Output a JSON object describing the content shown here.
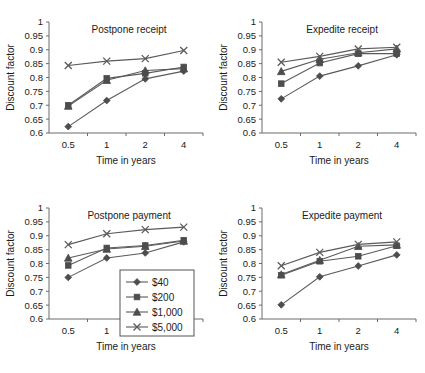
{
  "figure": {
    "name": "discount-factor-panels",
    "panel_count": 4
  },
  "axis": {
    "ylabel": "Discount factor",
    "xlabel": "Time in years",
    "ytick_labels": [
      "1",
      "0.95",
      "0.9",
      "0.85",
      "0.8",
      "0.75",
      "0.7",
      "0.65",
      "0.6"
    ],
    "xtick_labels": [
      "0.5",
      "1",
      "2",
      "4"
    ]
  },
  "legend": {
    "position": "bottom-left-panel-inset",
    "entries": [
      {
        "label": "$40",
        "marker": "diamond"
      },
      {
        "label": "$200",
        "marker": "square"
      },
      {
        "label": "$1,000",
        "marker": "triangle"
      },
      {
        "label": "$5,000",
        "marker": "cross-x"
      }
    ]
  },
  "colors": {
    "line": "#5a5a5a",
    "marker": "#4d4d4d",
    "axis": "#6b6b6b",
    "text": "#1a1a1a",
    "background": "#ffffff"
  },
  "chart_data": [
    {
      "type": "line",
      "title": "Postpone receipt",
      "xlabel": "Time in years",
      "ylabel": "Discount factor",
      "categories": [
        "0.5",
        "1",
        "2",
        "4"
      ],
      "ylim": [
        0.6,
        1
      ],
      "ytick_step": 0.05,
      "grid": false,
      "legend_position": "none",
      "series": [
        {
          "name": "$40",
          "marker": "diamond",
          "values": [
            0.623,
            0.717,
            0.795,
            0.823
          ]
        },
        {
          "name": "$200",
          "marker": "square",
          "values": [
            0.7,
            0.797,
            0.815,
            0.838
          ]
        },
        {
          "name": "$1,000",
          "marker": "triangle",
          "values": [
            0.697,
            0.79,
            0.825,
            0.832
          ]
        },
        {
          "name": "$5,000",
          "marker": "cross-x",
          "values": [
            0.843,
            0.859,
            0.868,
            0.897
          ]
        }
      ]
    },
    {
      "type": "line",
      "title": "Expedite receipt",
      "xlabel": "Time in years",
      "ylabel": "Discount factor",
      "categories": [
        "0.5",
        "1",
        "2",
        "4"
      ],
      "ylim": [
        0.6,
        1
      ],
      "ytick_step": 0.05,
      "grid": false,
      "legend_position": "none",
      "series": [
        {
          "name": "$40",
          "marker": "diamond",
          "values": [
            0.723,
            0.805,
            0.842,
            0.882
          ]
        },
        {
          "name": "$200",
          "marker": "square",
          "values": [
            0.778,
            0.852,
            0.886,
            0.886
          ]
        },
        {
          "name": "$1,000",
          "marker": "triangle",
          "values": [
            0.822,
            0.866,
            0.889,
            0.903
          ]
        },
        {
          "name": "$5,000",
          "marker": "cross-x",
          "values": [
            0.855,
            0.876,
            0.903,
            0.909
          ]
        }
      ]
    },
    {
      "type": "line",
      "title": "Postpone payment",
      "xlabel": "Time in years",
      "ylabel": "Discount factor",
      "categories": [
        "0.5",
        "1",
        "2",
        "4"
      ],
      "ylim": [
        0.6,
        1
      ],
      "ytick_step": 0.05,
      "grid": false,
      "legend_position": "inset-right",
      "series": [
        {
          "name": "$40",
          "marker": "diamond",
          "values": [
            0.75,
            0.82,
            0.838,
            0.878
          ]
        },
        {
          "name": "$200",
          "marker": "square",
          "values": [
            0.793,
            0.856,
            0.865,
            0.884
          ]
        },
        {
          "name": "$1,000",
          "marker": "triangle",
          "values": [
            0.82,
            0.852,
            0.862,
            0.881
          ]
        },
        {
          "name": "$5,000",
          "marker": "cross-x",
          "values": [
            0.868,
            0.907,
            0.922,
            0.931
          ]
        }
      ]
    },
    {
      "type": "line",
      "title": "Expedite payment",
      "xlabel": "Time in years",
      "ylabel": "Discount factor",
      "categories": [
        "0.5",
        "1",
        "2",
        "4"
      ],
      "ylim": [
        0.6,
        1
      ],
      "ytick_step": 0.05,
      "grid": false,
      "legend_position": "none",
      "series": [
        {
          "name": "$40",
          "marker": "diamond",
          "values": [
            0.651,
            0.752,
            0.791,
            0.831
          ]
        },
        {
          "name": "$200",
          "marker": "square",
          "values": [
            0.758,
            0.808,
            0.826,
            0.864
          ]
        },
        {
          "name": "$1,000",
          "marker": "triangle",
          "values": [
            0.76,
            0.812,
            0.862,
            0.867
          ]
        },
        {
          "name": "$5,000",
          "marker": "cross-x",
          "values": [
            0.792,
            0.84,
            0.869,
            0.878
          ]
        }
      ]
    }
  ]
}
